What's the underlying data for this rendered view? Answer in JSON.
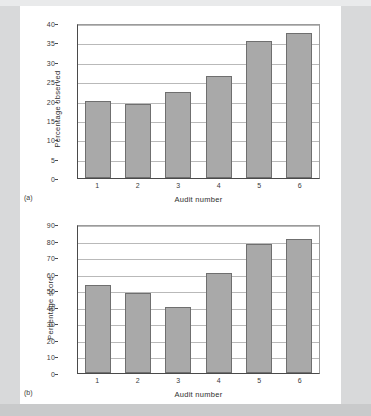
{
  "figure": {
    "panels": [
      {
        "panel_label": "(a)",
        "chart_data": {
          "type": "bar",
          "title": "",
          "xlabel": "Audit number",
          "ylabel": "Percentage observed",
          "categories": [
            "1",
            "2",
            "3",
            "4",
            "5",
            "6"
          ],
          "values": [
            20.0,
            19.2,
            22.2,
            26.2,
            35.3,
            37.5
          ],
          "ylim": [
            0,
            40
          ],
          "ytick_values": [
            0,
            5,
            10,
            15,
            20,
            25,
            30,
            35,
            40
          ],
          "ytick_labels": [
            "0",
            "5",
            "10",
            "15",
            "20",
            "25",
            "30",
            "35",
            "40"
          ],
          "grid": true,
          "legend": false,
          "bar_color": "#a9a9a9",
          "bar_edge_color": "#6f6f6f"
        }
      },
      {
        "panel_label": "(b)",
        "chart_data": {
          "type": "bar",
          "title": "",
          "xlabel": "Audit number",
          "ylabel": "Percentage score",
          "categories": [
            "1",
            "2",
            "3",
            "4",
            "5",
            "6"
          ],
          "values": [
            53.2,
            48.4,
            39.7,
            60.3,
            77.8,
            80.8
          ],
          "ylim": [
            0,
            90
          ],
          "ytick_values": [
            0,
            10,
            20,
            30,
            40,
            50,
            60,
            70,
            80,
            90
          ],
          "ytick_labels": [
            "0",
            "10",
            "20",
            "30",
            "40",
            "50",
            "60",
            "70",
            "80",
            "90"
          ],
          "grid": true,
          "legend": false,
          "bar_color": "#a9a9a9",
          "bar_edge_color": "#6f6f6f"
        }
      }
    ]
  }
}
